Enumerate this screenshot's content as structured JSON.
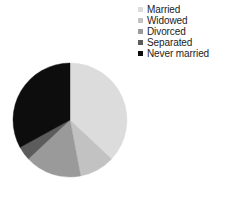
{
  "chart_data": {
    "type": "pie",
    "title": "",
    "subtitle": "",
    "xlabel": "",
    "ylabel": "",
    "grid": false,
    "legend_position": "top-right",
    "start_angle_deg": 0,
    "direction": "clockwise",
    "categories": [
      "Married",
      "Widowed",
      "Divorced",
      "Separated",
      "Never married"
    ],
    "values": [
      37,
      10,
      16,
      4,
      33
    ],
    "units": "percent",
    "slices": [
      {
        "label": "Married",
        "value": 37,
        "color": "#dcdcdc"
      },
      {
        "label": "Widowed",
        "value": 10,
        "color": "#c2c2c2"
      },
      {
        "label": "Divorced",
        "value": 16,
        "color": "#9a9a9a"
      },
      {
        "label": "Separated",
        "value": 4,
        "color": "#5c5c5c"
      },
      {
        "label": "Never married",
        "value": 33,
        "color": "#0d0d0d"
      }
    ]
  },
  "legend": {
    "items": [
      {
        "label": "Married",
        "color": "#dcdcdc"
      },
      {
        "label": "Widowed",
        "color": "#c2c2c2"
      },
      {
        "label": "Divorced",
        "color": "#9a9a9a"
      },
      {
        "label": "Separated",
        "color": "#5c5c5c"
      },
      {
        "label": "Never married",
        "color": "#0d0d0d"
      }
    ]
  },
  "colors": {
    "background": "#ffffff",
    "text": "#1c1c1c",
    "married": "#dcdcdc",
    "widowed": "#c2c2c2",
    "divorced": "#9a9a9a",
    "separated": "#5c5c5c",
    "never_married": "#0d0d0d"
  }
}
